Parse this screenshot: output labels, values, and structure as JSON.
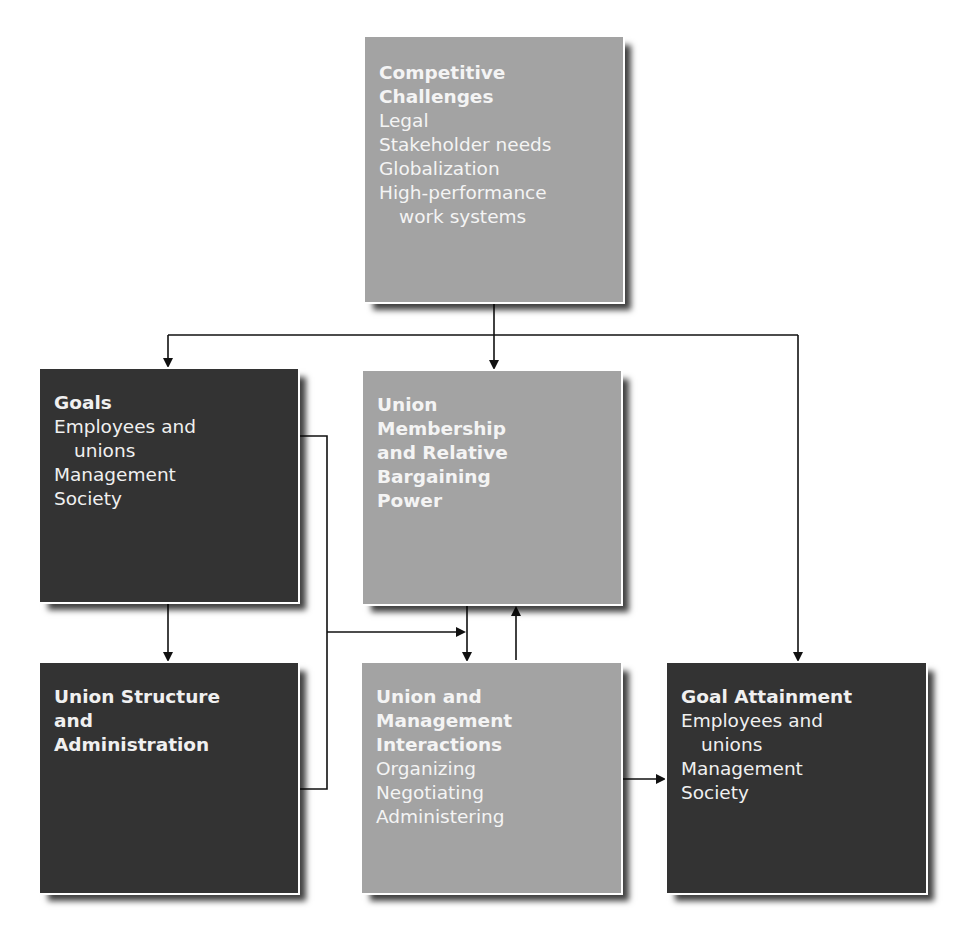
{
  "corner_fragment": "g g",
  "boxes": {
    "competitive_challenges": {
      "title_lines": [
        "Competitive",
        "Challenges"
      ],
      "items": [
        "Legal",
        "Stakeholder needs",
        "Globalization",
        "High-performance",
        "work systems"
      ],
      "color": "#a3a3a3"
    },
    "goals": {
      "title_lines": [
        "Goals"
      ],
      "items": [
        "Employees and",
        "unions",
        "Management",
        "Society"
      ],
      "color": "#333333"
    },
    "union_membership": {
      "title_lines": [
        "Union",
        "Membership",
        "and Relative",
        "Bargaining",
        "Power"
      ],
      "items": [],
      "color": "#a3a3a3"
    },
    "union_structure": {
      "title_lines": [
        "Union Structure",
        "and",
        "Administration"
      ],
      "items": [],
      "color": "#333333"
    },
    "union_management_interactions": {
      "title_lines": [
        "Union and",
        "Management",
        "Interactions"
      ],
      "items": [
        "Organizing",
        "Negotiating",
        "Administering"
      ],
      "color": "#a3a3a3"
    },
    "goal_attainment": {
      "title_lines": [
        "Goal Attainment"
      ],
      "items": [
        "Employees and",
        "unions",
        "Management",
        "Society"
      ],
      "color": "#333333"
    }
  },
  "connections": [
    {
      "from": "Competitive Challenges",
      "to": "Goals"
    },
    {
      "from": "Competitive Challenges",
      "to": "Union Membership and Relative Bargaining Power"
    },
    {
      "from": "Competitive Challenges",
      "to": "Goal Attainment"
    },
    {
      "from": "Goals",
      "to": "Union Structure and Administration"
    },
    {
      "from": "Goals",
      "to": "Union and Management Interactions"
    },
    {
      "from": "Union Structure and Administration",
      "to": "Union and Management Interactions"
    },
    {
      "from": "Union Membership and Relative Bargaining Power",
      "to": "Union and Management Interactions"
    },
    {
      "from": "Union and Management Interactions",
      "to": "Union Membership and Relative Bargaining Power"
    },
    {
      "from": "Union and Management Interactions",
      "to": "Goal Attainment"
    }
  ]
}
